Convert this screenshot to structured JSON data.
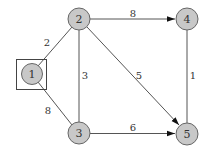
{
  "diagram": {
    "type": "weighted-graph",
    "nodes": [
      {
        "id": "1",
        "label": "1",
        "x": 32,
        "y": 74,
        "highlighted_box": true
      },
      {
        "id": "2",
        "label": "2",
        "x": 79,
        "y": 19
      },
      {
        "id": "3",
        "label": "3",
        "x": 79,
        "y": 133
      },
      {
        "id": "4",
        "label": "4",
        "x": 187,
        "y": 19
      },
      {
        "id": "5",
        "label": "5",
        "x": 187,
        "y": 134
      }
    ],
    "edges": [
      {
        "from": "1",
        "to": "2",
        "weight": "2",
        "directed": false
      },
      {
        "from": "1",
        "to": "3",
        "weight": "8",
        "directed": false
      },
      {
        "from": "2",
        "to": "3",
        "weight": "3",
        "directed": false
      },
      {
        "from": "2",
        "to": "4",
        "weight": "8",
        "directed": true
      },
      {
        "from": "2",
        "to": "5",
        "weight": "5",
        "directed": true
      },
      {
        "from": "3",
        "to": "5",
        "weight": "6",
        "directed": true
      },
      {
        "from": "4",
        "to": "5",
        "weight": "1",
        "directed": false
      }
    ]
  }
}
